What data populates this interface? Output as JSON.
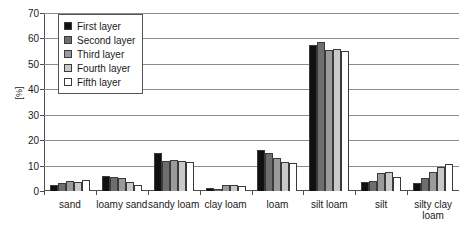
{
  "chart_data": {
    "type": "bar",
    "title": "",
    "xlabel": "",
    "ylabel": "[%]",
    "ylim": [
      0,
      70
    ],
    "ytick_step": 10,
    "yticks": [
      0,
      10,
      20,
      30,
      40,
      50,
      60,
      70
    ],
    "grid": true,
    "legend_position": "top-left",
    "categories": [
      "sand",
      "loamy sand",
      "sandy loam",
      "clay loam",
      "loam",
      "silt loam",
      "silt",
      "silty clay loam"
    ],
    "series": [
      {
        "name": "First layer",
        "color": "#111111",
        "values": [
          2.5,
          6.0,
          15.0,
          1.0,
          16.0,
          57.5,
          3.5,
          3.0
        ]
      },
      {
        "name": "Second layer",
        "color": "#6e6e6e",
        "values": [
          3.0,
          5.5,
          11.8,
          0.8,
          15.0,
          58.5,
          4.0,
          5.0
        ]
      },
      {
        "name": "Third layer",
        "color": "#9a9a9a",
        "values": [
          4.0,
          5.0,
          12.3,
          2.2,
          13.0,
          55.5,
          7.0,
          7.5
        ]
      },
      {
        "name": "Fourth layer",
        "color": "#c9c9c9",
        "values": [
          3.5,
          3.5,
          11.8,
          2.2,
          11.5,
          56.0,
          7.5,
          9.5
        ]
      },
      {
        "name": "Fifth layer",
        "color": "#ffffff",
        "values": [
          4.5,
          2.5,
          11.3,
          2.0,
          11.0,
          55.0,
          5.5,
          10.5
        ]
      }
    ]
  },
  "axis": {
    "y_title": "[%]"
  }
}
